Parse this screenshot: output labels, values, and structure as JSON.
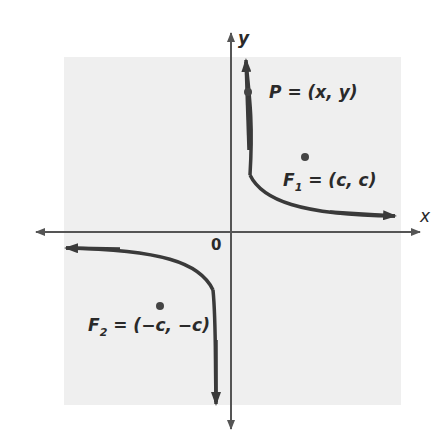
{
  "figure": {
    "background_panel_color": "#efefef",
    "axis_color": "#555555",
    "curve_color": "#3a3a3a",
    "axes": {
      "x_label": "x",
      "y_label": "y",
      "origin_label": "0"
    },
    "points": {
      "P": {
        "name": "P",
        "label": "P = (x, y)"
      },
      "F1": {
        "name": "F",
        "sub": "1",
        "label_rest": " = (c, c)"
      },
      "F2": {
        "name": "F",
        "sub": "2",
        "label_rest": " = (−c, −c)"
      }
    }
  }
}
